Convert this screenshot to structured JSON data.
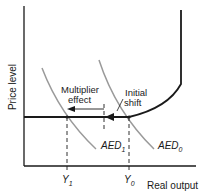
{
  "diagram": {
    "axes": {
      "y_label": "Price level",
      "x_label": "Real output"
    },
    "curves": {
      "aed0": {
        "name": "AED",
        "sub": "0"
      },
      "aed1": {
        "name": "AED",
        "sub": "1"
      },
      "supply": "aggregate supply curve"
    },
    "annotations": {
      "multiplier_line1": "Multiplier",
      "multiplier_line2": "effect",
      "initial_line1": "Initial",
      "initial_line2": "shift"
    },
    "ticks": {
      "y1": {
        "name": "Y",
        "sub": "1"
      },
      "y0": {
        "name": "Y",
        "sub": "0"
      }
    },
    "colors": {
      "axis": "#1a1a1a",
      "demand": "#9a9a9a",
      "supply": "#1a1a1a"
    }
  }
}
